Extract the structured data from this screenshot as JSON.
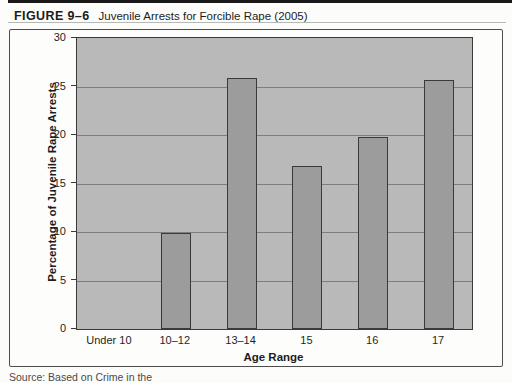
{
  "page": {
    "figure_label": "FIGURE 9–6",
    "figure_caption": "Juvenile Arrests for Forcible Rape (2005)",
    "source_partial": "Source: Based on Crime in the"
  },
  "chart_data": {
    "type": "bar",
    "title": "Juvenile Arrests for Forcible Rape (2005)",
    "categories": [
      "Under 10",
      "10–12",
      "13–14",
      "15",
      "16",
      "17"
    ],
    "values": [
      0,
      9.9,
      25.9,
      16.8,
      19.8,
      25.7
    ],
    "xlabel": "Age Range",
    "ylabel": "Percentage of Juvenile Rape Arrests",
    "ylim": [
      0,
      30
    ],
    "yticks": [
      0,
      5,
      10,
      15,
      20,
      25,
      30
    ],
    "grid": true,
    "legend": "none",
    "colors": {
      "plot_bg": "#b9b9b9",
      "bar_fill": "#9c9c9c",
      "bar_border": "#3a3a3a",
      "gridline": "#7d7d7d",
      "axis_text": "#1f1f1f"
    }
  }
}
